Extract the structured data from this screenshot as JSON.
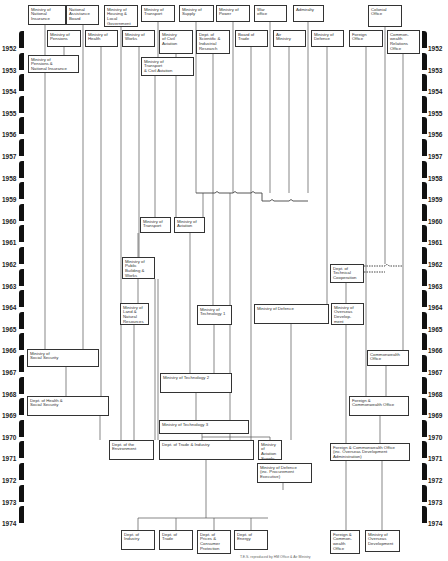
{
  "years": [
    "1952",
    "1953",
    "1954",
    "1955",
    "1956",
    "1957",
    "1958",
    "1959",
    "1960",
    "1961",
    "1962",
    "1963",
    "1964",
    "1965",
    "1966",
    "1967",
    "1968",
    "1969",
    "1970",
    "1971",
    "1972",
    "1973",
    "1974"
  ],
  "top_row": [
    {
      "id": "nat-ins",
      "label": "Ministry of\nNational\nInsurance",
      "x": 28,
      "y": 5,
      "w": 38,
      "h": 20
    },
    {
      "id": "nab",
      "label": "National\nAssistance\nBoard",
      "x": 66,
      "y": 5,
      "w": 33,
      "h": 20
    },
    {
      "id": "housing",
      "label": "Ministry of\nHousing &\nLocal\nGovernment",
      "x": 104,
      "y": 5,
      "w": 34,
      "h": 22
    },
    {
      "id": "transport",
      "label": "Ministry of\nTransport",
      "x": 141,
      "y": 5,
      "w": 34,
      "h": 17
    },
    {
      "id": "supply",
      "label": "Ministry of\nSupply",
      "x": 179,
      "y": 5,
      "w": 35,
      "h": 17
    },
    {
      "id": "power",
      "label": "Ministry of\nPower",
      "x": 216,
      "y": 5,
      "w": 34,
      "h": 17
    },
    {
      "id": "war",
      "label": "War\noffice",
      "x": 254,
      "y": 5,
      "w": 33,
      "h": 17
    },
    {
      "id": "admiralty",
      "label": "Admiralty",
      "x": 293,
      "y": 5,
      "w": 31,
      "h": 17
    },
    {
      "id": "colonial",
      "label": "Colonial\nOffice",
      "x": 368,
      "y": 5,
      "w": 34,
      "h": 22
    }
  ],
  "second_row": [
    {
      "id": "pensions",
      "label": "Ministry of\nPensions",
      "x": 47,
      "y": 30,
      "w": 34,
      "h": 17
    },
    {
      "id": "health",
      "label": "Ministry of\nHealth",
      "x": 85,
      "y": 30,
      "w": 33,
      "h": 17
    },
    {
      "id": "works",
      "label": "Ministry of\nWorks",
      "x": 122,
      "y": 30,
      "w": 33,
      "h": 17
    },
    {
      "id": "civil-aviation",
      "label": "Ministry\nof Civil\nAviation",
      "x": 159,
      "y": 30,
      "w": 34,
      "h": 24
    },
    {
      "id": "dsir",
      "label": "Dept. of\nScientific &\nIndustrial\nResearch",
      "x": 196,
      "y": 30,
      "w": 34,
      "h": 24
    },
    {
      "id": "board-trade",
      "label": "Board of\nTrade",
      "x": 235,
      "y": 30,
      "w": 33,
      "h": 17
    },
    {
      "id": "air",
      "label": "Air\nMinistry",
      "x": 273,
      "y": 30,
      "w": 33,
      "h": 17
    },
    {
      "id": "defence",
      "label": "Ministry of\nDefence",
      "x": 311,
      "y": 30,
      "w": 33,
      "h": 17
    },
    {
      "id": "foreign",
      "label": "Foreign\nOffice",
      "x": 349,
      "y": 30,
      "w": 34,
      "h": 17
    },
    {
      "id": "cro",
      "label": "Common-\nwealth\nRelations\nOffice",
      "x": 387,
      "y": 30,
      "w": 33,
      "h": 24
    }
  ],
  "mid_boxes": [
    {
      "id": "pni",
      "label": "Ministry of\nPensions &\nNational Insurance",
      "x": 28,
      "y": 55,
      "w": 51,
      "h": 18
    },
    {
      "id": "mtca",
      "label": "Ministry of\nTransport\n& Civil Aviation",
      "x": 141,
      "y": 57,
      "w": 53,
      "h": 19
    },
    {
      "id": "mot59",
      "label": "Ministry of\nTransport",
      "x": 140,
      "y": 217,
      "w": 31,
      "h": 16
    },
    {
      "id": "moa59",
      "label": "Ministry of\nAviation",
      "x": 174,
      "y": 217,
      "w": 31,
      "h": 16
    },
    {
      "id": "dtc",
      "label": "Dept. of\nTechnical\nCooperation",
      "x": 330,
      "y": 264,
      "w": 34,
      "h": 19
    },
    {
      "id": "mpbw",
      "label": "Ministry of\nPublic\nBuilding &\nWorks",
      "x": 122,
      "y": 257,
      "w": 33,
      "h": 22
    },
    {
      "id": "mlnr",
      "label": "Ministry of\nLand &\nNatural\nResources",
      "x": 120,
      "y": 303,
      "w": 29,
      "h": 22
    },
    {
      "id": "tech1",
      "label": "Ministry of\nTechnology 1",
      "x": 197,
      "y": 305,
      "w": 35,
      "h": 20
    },
    {
      "id": "mod64",
      "label": "Ministry of Defence",
      "x": 254,
      "y": 304,
      "w": 75,
      "h": 20
    },
    {
      "id": "mod-od",
      "label": "Ministry of\nOverseas\nDevelop-\nment",
      "x": 331,
      "y": 303,
      "w": 33,
      "h": 22
    },
    {
      "id": "mss",
      "label": "Ministry of\nSocial Security",
      "x": 27,
      "y": 349,
      "w": 72,
      "h": 18
    },
    {
      "id": "co66",
      "label": "Commonwealth\nOffice",
      "x": 367,
      "y": 350,
      "w": 42,
      "h": 16
    },
    {
      "id": "tech2",
      "label": "Ministry of Technology 2",
      "x": 160,
      "y": 373,
      "w": 72,
      "h": 20
    },
    {
      "id": "dhss",
      "label": "Dept. of Health &\nSocial Security",
      "x": 27,
      "y": 396,
      "w": 82,
      "h": 20
    },
    {
      "id": "fco68",
      "label": "Foreign &\nCommonwealth Office",
      "x": 349,
      "y": 396,
      "w": 60,
      "h": 20
    },
    {
      "id": "tech3",
      "label": "Ministry of Technology 3",
      "x": 159,
      "y": 420,
      "w": 90,
      "h": 14
    },
    {
      "id": "doe",
      "label": "Dept. of the\nEnvironment",
      "x": 109,
      "y": 440,
      "w": 45,
      "h": 20
    },
    {
      "id": "dti",
      "label": "Dept. of Trade & Industry",
      "x": 159,
      "y": 440,
      "w": 95,
      "h": 20
    },
    {
      "id": "mas",
      "label": "Ministry\nof\nAviation\nSupply",
      "x": 258,
      "y": 440,
      "w": 24,
      "h": 20
    },
    {
      "id": "fco70",
      "label": "Foreign & Commonwealth Office\n(inc. Overseas Development\nAdministration)",
      "x": 330,
      "y": 443,
      "w": 80,
      "h": 18
    },
    {
      "id": "mod-pe",
      "label": "Ministry of Defence\n(inc. Procurement\nExecutive)",
      "x": 257,
      "y": 463,
      "w": 55,
      "h": 20
    }
  ],
  "bottom_row": [
    {
      "id": "doi",
      "label": "Dept. of\nIndustry",
      "x": 121,
      "y": 530,
      "w": 34,
      "h": 20
    },
    {
      "id": "dot",
      "label": "Dept. of\nTrade",
      "x": 159,
      "y": 530,
      "w": 34,
      "h": 20
    },
    {
      "id": "dpcp",
      "label": "Dept. of\nPrices &\nConsumer\nProtection",
      "x": 197,
      "y": 530,
      "w": 34,
      "h": 24
    },
    {
      "id": "doen",
      "label": "Dept. of\nEnergy",
      "x": 234,
      "y": 530,
      "w": 34,
      "h": 20
    },
    {
      "id": "fco74",
      "label": "Foreign &\nCommon-\nwealth\nOffice",
      "x": 330,
      "y": 530,
      "w": 30,
      "h": 24
    },
    {
      "id": "mod74",
      "label": "Ministry of\nOverseas\nDevelopment",
      "x": 365,
      "y": 530,
      "w": 35,
      "h": 22
    }
  ],
  "footnote": "T.E.S. reproduced by HM Office & Air Ministry"
}
